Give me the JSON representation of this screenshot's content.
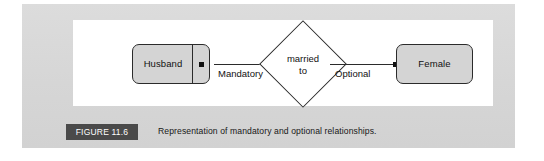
{
  "figure": {
    "badge_label": "FIGURE 11.6",
    "caption": "Representation of mandatory and optional relationships.",
    "panel_color": "#d9d9d9",
    "badge_color": "#4a4a4a",
    "canvas_color": "#ffffff"
  },
  "diagram": {
    "type": "entity-relationship",
    "entity_fill": "#d4d4d4",
    "line_color": "#2b2b2b",
    "entities": [
      {
        "id": "husband",
        "label": "Husband",
        "has_divider": true
      },
      {
        "id": "female",
        "label": "Female",
        "has_divider": false
      }
    ],
    "relationship": {
      "label_line1": "married",
      "label_line2": "to",
      "shape": "diamond"
    },
    "connectors": [
      {
        "id": "left",
        "label": "Mandatory",
        "from": "husband",
        "to": "relationship",
        "endpoint_marker": "filled-dot"
      },
      {
        "id": "right",
        "label": "Optional",
        "from": "relationship",
        "to": "female",
        "endpoint_marker": "filled-dot"
      }
    ]
  }
}
